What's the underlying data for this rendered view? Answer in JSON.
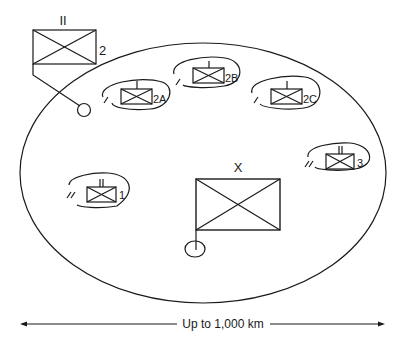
{
  "diagram": {
    "type": "military-deployment-area",
    "area_boundary": "large-ellipse",
    "units": [
      {
        "id": "hq-2",
        "label": "2",
        "echelon": "II",
        "position": "outside-top-left",
        "role": "battalion-hq"
      },
      {
        "id": "2A",
        "label": "2A",
        "echelon": "I",
        "position": "inside-top-left"
      },
      {
        "id": "2B",
        "label": "2B",
        "echelon": "I",
        "position": "inside-top-center"
      },
      {
        "id": "2C",
        "label": "2C",
        "echelon": "I",
        "position": "inside-top-right"
      },
      {
        "id": "3",
        "label": "3",
        "echelon": "II",
        "position": "inside-right"
      },
      {
        "id": "1",
        "label": "1",
        "echelon": "II",
        "position": "inside-left"
      },
      {
        "id": "X",
        "label": "",
        "echelon": "X",
        "position": "inside-center",
        "role": "brigade-hq"
      }
    ],
    "scale": {
      "label": "Up to 1,000 km"
    }
  }
}
